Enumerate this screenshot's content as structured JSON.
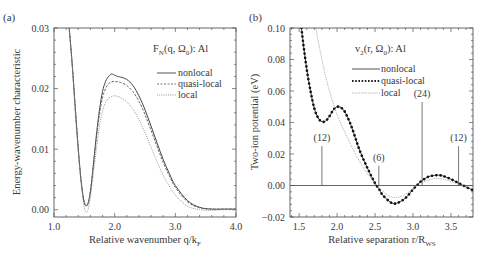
{
  "chart_data": [
    {
      "panel_label": "(a)",
      "type": "line",
      "title": "F_N(q, Ω_0): Al",
      "title_parts": {
        "main": "F",
        "sub1": "N",
        "mid": "(q, Ω",
        "sub2": "0",
        "end": "): Al"
      },
      "xlabel": "Relative wavenumber q/k_F",
      "xlabel_parts": {
        "main": "Relative wavenumber q/k",
        "sub": "F"
      },
      "ylabel": "Energy-wavenumber characteristic",
      "xlim": [
        1.0,
        4.0
      ],
      "ylim": [
        -0.0012,
        0.03
      ],
      "xticks": [
        "1.0",
        "2.0",
        "3.0",
        "4.0"
      ],
      "xtick_values": [
        1.0,
        2.0,
        3.0,
        4.0
      ],
      "yticks": [
        "0.00",
        "0.01",
        "0.02",
        "0.03"
      ],
      "ytick_values": [
        0.0,
        0.01,
        0.02,
        0.03
      ],
      "grid": false,
      "legend_position": "upper right",
      "series": [
        {
          "name": "nonlocal",
          "style": "solid",
          "x": [
            1.25,
            1.3,
            1.35,
            1.4,
            1.45,
            1.5,
            1.55,
            1.6,
            1.65,
            1.7,
            1.75,
            1.8,
            1.85,
            1.9,
            1.95,
            2.0,
            2.05,
            2.1,
            2.2,
            2.3,
            2.4,
            2.5,
            2.6,
            2.7,
            2.8,
            2.9,
            3.0,
            3.2,
            3.4,
            3.6,
            3.8,
            4.0
          ],
          "values": [
            0.03,
            0.024,
            0.017,
            0.01,
            0.0045,
            0.0012,
            0.0008,
            0.003,
            0.0075,
            0.0125,
            0.0165,
            0.0195,
            0.0212,
            0.022,
            0.0224,
            0.0222,
            0.022,
            0.0219,
            0.0215,
            0.0205,
            0.0188,
            0.0165,
            0.0138,
            0.011,
            0.0083,
            0.006,
            0.004,
            0.0015,
            0.0004,
            0.0001,
            0.0001,
            0.0001
          ]
        },
        {
          "name": "quasi-local",
          "style": "dashed",
          "x": [
            1.25,
            1.3,
            1.35,
            1.4,
            1.45,
            1.5,
            1.55,
            1.6,
            1.65,
            1.7,
            1.75,
            1.8,
            1.85,
            1.9,
            1.95,
            2.0,
            2.05,
            2.1,
            2.2,
            2.3,
            2.4,
            2.5,
            2.6,
            2.7,
            2.8,
            2.9,
            3.0,
            3.2,
            3.4,
            3.6,
            3.8,
            4.0
          ],
          "values": [
            0.03,
            0.024,
            0.017,
            0.01,
            0.0045,
            0.0012,
            0.0008,
            0.003,
            0.0073,
            0.012,
            0.0158,
            0.0185,
            0.02,
            0.0208,
            0.0211,
            0.0212,
            0.0211,
            0.021,
            0.0205,
            0.0195,
            0.0179,
            0.0157,
            0.0131,
            0.0104,
            0.0078,
            0.0056,
            0.0037,
            0.0013,
            0.0003,
            0.0001,
            0.0001,
            0.0001
          ]
        },
        {
          "name": "local",
          "style": "dotted",
          "x": [
            1.25,
            1.3,
            1.35,
            1.4,
            1.45,
            1.5,
            1.55,
            1.6,
            1.65,
            1.7,
            1.75,
            1.8,
            1.85,
            1.9,
            1.95,
            2.0,
            2.05,
            2.1,
            2.2,
            2.3,
            2.4,
            2.5,
            2.6,
            2.7,
            2.8,
            2.9,
            3.0,
            3.2,
            3.4,
            3.6,
            3.8,
            4.0
          ],
          "values": [
            0.03,
            0.024,
            0.016,
            0.0095,
            0.004,
            0.0003,
            -0.0003,
            0.002,
            0.006,
            0.0102,
            0.0138,
            0.0163,
            0.0177,
            0.0184,
            0.0187,
            0.0188,
            0.0187,
            0.0185,
            0.0178,
            0.0166,
            0.0149,
            0.0127,
            0.0103,
            0.0079,
            0.0057,
            0.0039,
            0.0024,
            0.0006,
            0.0,
            -0.0001,
            0.0,
            0.0
          ]
        }
      ]
    },
    {
      "panel_label": "(b)",
      "type": "line",
      "title": "v_2(r, Ω_0): Al",
      "title_parts": {
        "main": "v",
        "sub1": "2",
        "mid": "(r, Ω",
        "sub2": "0",
        "end": "): Al"
      },
      "xlabel": "Relative separation r/R_WS",
      "xlabel_parts": {
        "main": "Relative separation r/R",
        "sub": "WS"
      },
      "ylabel": "Two-ion potential (eV)",
      "xlim": [
        1.38,
        3.79
      ],
      "ylim": [
        -0.02,
        0.1
      ],
      "xticks": [
        "1.5",
        "2.0",
        "2.5",
        "3.0",
        "3.5"
      ],
      "xtick_values": [
        1.5,
        2.0,
        2.5,
        3.0,
        3.5
      ],
      "yticks": [
        "−0.02",
        "0.00",
        "0.02",
        "0.04",
        "0.06",
        "0.08",
        "0.10"
      ],
      "ytick_values": [
        -0.02,
        0.0,
        0.02,
        0.04,
        0.06,
        0.08,
        0.1
      ],
      "grid": false,
      "legend_position": "upper right",
      "zero_line": true,
      "annotations": [
        {
          "label": "(12)",
          "x": 1.8,
          "y_top": 0.025
        },
        {
          "label": "(6)",
          "x": 2.55,
          "y_top": 0.0125
        },
        {
          "label": "(24)",
          "x": 3.12,
          "y_top": 0.053
        },
        {
          "label": "(12)",
          "x": 3.6,
          "y_top": 0.025
        }
      ],
      "series": [
        {
          "name": "nonlocal",
          "style": "solid",
          "x": [
            1.53,
            1.56,
            1.6,
            1.65,
            1.7,
            1.75,
            1.8,
            1.85,
            1.9,
            1.95,
            2.0,
            2.05,
            2.1,
            2.15,
            2.2,
            2.3,
            2.4,
            2.5,
            2.55,
            2.6,
            2.7,
            2.75,
            2.8,
            2.9,
            3.0,
            3.05,
            3.1,
            3.2,
            3.3,
            3.35,
            3.4,
            3.5,
            3.6,
            3.7,
            3.79
          ],
          "values": [
            0.1,
            0.088,
            0.074,
            0.06,
            0.049,
            0.043,
            0.0405,
            0.041,
            0.044,
            0.048,
            0.05,
            0.0495,
            0.047,
            0.042,
            0.036,
            0.022,
            0.011,
            0.0015,
            -0.002,
            -0.006,
            -0.0105,
            -0.0115,
            -0.011,
            -0.008,
            -0.0025,
            0.0,
            0.0025,
            0.0055,
            0.0065,
            0.0065,
            0.006,
            0.004,
            0.0015,
            -0.001,
            -0.003
          ]
        },
        {
          "name": "quasi-local",
          "style": "dotted-thick",
          "x": [
            1.53,
            1.56,
            1.6,
            1.65,
            1.7,
            1.75,
            1.8,
            1.85,
            1.9,
            1.95,
            2.0,
            2.05,
            2.1,
            2.15,
            2.2,
            2.3,
            2.4,
            2.5,
            2.55,
            2.6,
            2.7,
            2.75,
            2.8,
            2.9,
            3.0,
            3.05,
            3.1,
            3.2,
            3.3,
            3.35,
            3.4,
            3.5,
            3.6,
            3.7,
            3.79
          ],
          "values": [
            0.1,
            0.088,
            0.074,
            0.06,
            0.049,
            0.043,
            0.0405,
            0.041,
            0.044,
            0.048,
            0.05,
            0.0495,
            0.047,
            0.042,
            0.036,
            0.022,
            0.011,
            0.0015,
            -0.002,
            -0.006,
            -0.0105,
            -0.0115,
            -0.011,
            -0.008,
            -0.0025,
            0.0,
            0.0025,
            0.0055,
            0.0065,
            0.0065,
            0.006,
            0.004,
            0.0015,
            -0.001,
            -0.003
          ]
        },
        {
          "name": "local",
          "style": "dotted-thin",
          "x": [
            1.72,
            1.75,
            1.8,
            1.85,
            1.9,
            1.95,
            2.0,
            2.1,
            2.2,
            2.3,
            2.4,
            2.5,
            2.55,
            2.6,
            2.7,
            2.8,
            2.9,
            3.0,
            3.05,
            3.1,
            3.2,
            3.3,
            3.4,
            3.5,
            3.6,
            3.7,
            3.79
          ],
          "values": [
            0.1,
            0.092,
            0.08,
            0.069,
            0.06,
            0.052,
            0.045,
            0.034,
            0.024,
            0.015,
            0.0075,
            0.0015,
            -0.001,
            -0.0035,
            -0.007,
            -0.0075,
            -0.0055,
            -0.002,
            0.0,
            0.0015,
            0.0035,
            0.0045,
            0.004,
            0.0025,
            0.0008,
            -0.0008,
            -0.002
          ]
        }
      ]
    }
  ]
}
